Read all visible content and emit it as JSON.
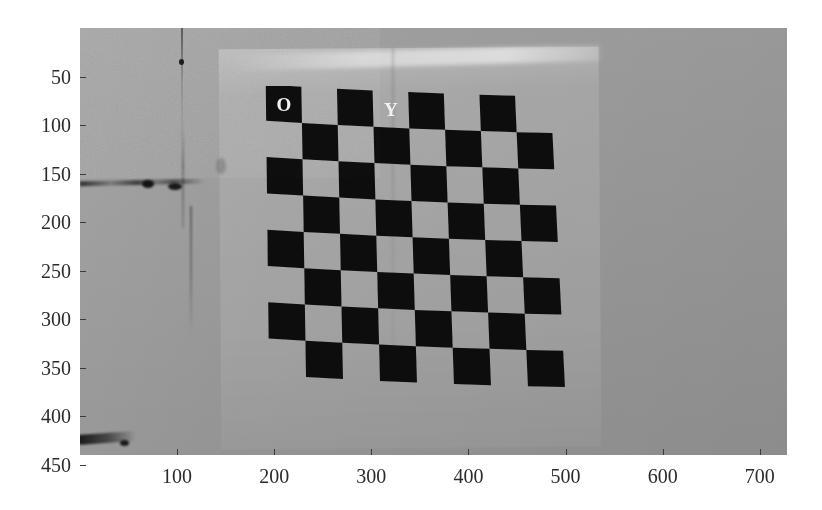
{
  "figure": {
    "kind": "camera-calibration-photograph"
  },
  "axes": {
    "x": {
      "label": "",
      "ticks": [
        100,
        200,
        300,
        400,
        500,
        600,
        700
      ],
      "tick_labels": [
        "100",
        "200",
        "300",
        "400",
        "500",
        "600",
        "700"
      ],
      "range": [
        0,
        728
      ],
      "units": "pixels"
    },
    "y": {
      "label": "",
      "ticks": [
        50,
        100,
        150,
        200,
        250,
        300,
        350,
        400,
        450
      ],
      "tick_labels": [
        "50",
        "100",
        "150",
        "200",
        "250",
        "300",
        "350",
        "400",
        "450"
      ],
      "range": [
        0,
        440
      ],
      "units": "pixels",
      "direction": "down"
    }
  },
  "image": {
    "background_color": "#9b9b9b",
    "paper_color": "#c2c2c2",
    "square_color": "#101010",
    "letter_color": "#f2f2f2"
  },
  "target": {
    "type": "checkerboard",
    "rows": 8,
    "cols": 8,
    "origin_marker": {
      "label": "O",
      "row": 0,
      "col": 0,
      "meaning": "origin corner"
    },
    "axis_marker": {
      "label": "Y",
      "row": 0,
      "col": 3,
      "meaning": "Y axis direction"
    },
    "markers": [
      "O",
      "Y"
    ]
  },
  "chart_data": {
    "type": "image",
    "title": "",
    "xlabel": "",
    "ylabel": "",
    "xlim": [
      0,
      728
    ],
    "ylim": [
      440,
      0
    ],
    "grid": false,
    "legend": "none",
    "xticks": [
      100,
      200,
      300,
      400,
      500,
      600,
      700
    ],
    "yticks": [
      50,
      100,
      150,
      200,
      250,
      300,
      350,
      400,
      450
    ],
    "annotations": [
      {
        "text": "O",
        "x": 212,
        "y": 96
      },
      {
        "text": "Y",
        "x": 347,
        "y": 88
      }
    ]
  }
}
